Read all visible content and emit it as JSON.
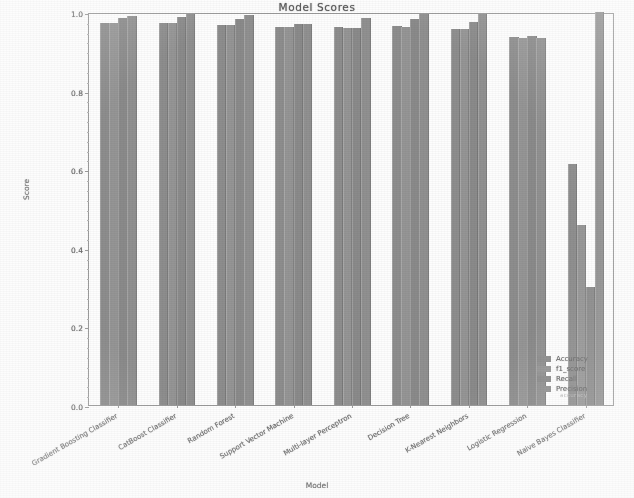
{
  "chart_data": {
    "type": "bar",
    "title": "Model Scores",
    "xlabel": "Model",
    "ylabel": "Score",
    "ylim": [
      0.0,
      1.0
    ],
    "ytick_labels": [
      "0.0",
      "0.2",
      "0.4",
      "0.6",
      "0.8",
      "1.0"
    ],
    "ytick_values": [
      0.0,
      0.2,
      0.4,
      0.6,
      0.8,
      1.0
    ],
    "grid": false,
    "legend_position": "lower right",
    "categories": [
      "Gradient Boosting Classifier",
      "CatBoost Classifier",
      "Random Forest",
      "Support Vector Machine",
      "Multi-layer Perceptron",
      "Decision Tree",
      "K-Nearest Neighbors",
      "Logistic Regression",
      "Naive Bayes Classifier"
    ],
    "series": [
      {
        "name": "Accuracy",
        "color": "#8d8d8d",
        "values": [
          0.972,
          0.972,
          0.967,
          0.962,
          0.961,
          0.964,
          0.958,
          0.936,
          0.612
        ]
      },
      {
        "name": "f1_score",
        "color": "#959595",
        "values": [
          0.971,
          0.972,
          0.966,
          0.961,
          0.96,
          0.963,
          0.957,
          0.935,
          0.459
        ]
      },
      {
        "name": "Recall",
        "color": "#8a8a8a",
        "values": [
          0.985,
          0.988,
          0.982,
          0.969,
          0.96,
          0.981,
          0.974,
          0.94,
          0.3
        ]
      },
      {
        "name": "Precision",
        "color": "#909090",
        "values": [
          0.991,
          0.995,
          0.993,
          0.969,
          0.985,
          0.995,
          0.995,
          0.933,
          1.0
        ]
      }
    ]
  },
  "legend": {
    "items": [
      "Accuracy",
      "f1_score",
      "Recall",
      "Precision"
    ],
    "ghost_text": "accuracy"
  }
}
